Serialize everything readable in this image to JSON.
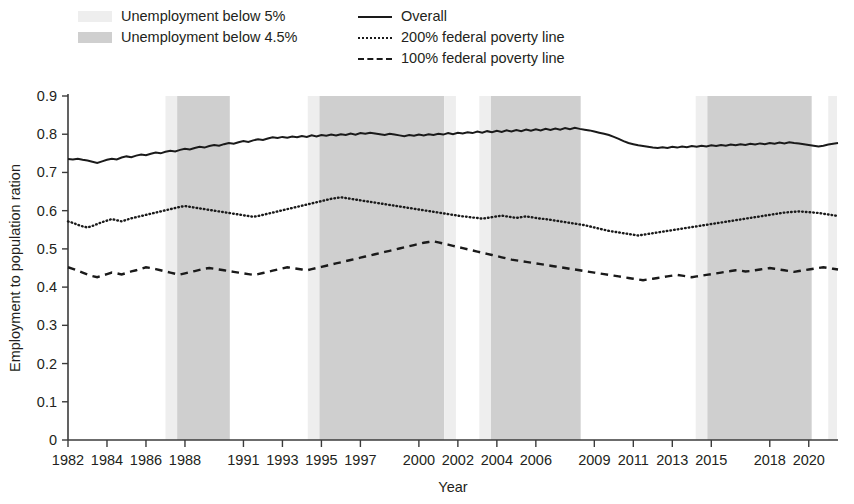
{
  "legend": {
    "bands": [
      {
        "label": "Unemployment below 5%",
        "color": "#eeeeee",
        "name": "band-below-5"
      },
      {
        "label": "Unemployment below 4.5%",
        "color": "#cfcfcf",
        "name": "band-below-4-5"
      }
    ],
    "series": [
      {
        "label": "Overall",
        "style": "solid"
      },
      {
        "label": "200% federal poverty line",
        "style": "dotted"
      },
      {
        "label": "100% federal poverty line",
        "style": "dashed"
      }
    ]
  },
  "chart_data": {
    "type": "line",
    "title": "",
    "xlabel": "Year",
    "ylabel": "Employment to population ration",
    "xlim": [
      1982,
      2021.5
    ],
    "ylim": [
      0,
      0.9
    ],
    "grid": false,
    "legend_position": "top",
    "line_color": "#1a1a1a",
    "ytick_labels": [
      "0",
      "0.1",
      "0.2",
      "0.3",
      "0.4",
      "0.5",
      "0.6",
      "0.7",
      "0.8",
      "0.9"
    ],
    "ytick_values": [
      0,
      0.1,
      0.2,
      0.3,
      0.4,
      0.5,
      0.6,
      0.7,
      0.8,
      0.9
    ],
    "xtick_labels": [
      "1982",
      "1984",
      "1986",
      "1988",
      "1991",
      "1993",
      "1995",
      "1997",
      "2000",
      "2002",
      "2004",
      "2006",
      "2009",
      "2011",
      "2013",
      "2015",
      "2018",
      "2020"
    ],
    "xtick_values": [
      1982,
      1984,
      1986,
      1988,
      1991,
      1993,
      1995,
      1997,
      2000,
      2002,
      2004,
      2006,
      2009,
      2011,
      2013,
      2015,
      2018,
      2020
    ],
    "shaded_bands": [
      {
        "name": "unemployment-below-5",
        "color": "#eeeeee",
        "x0": 1987.0,
        "x1": 1987.6
      },
      {
        "name": "unemployment-below-4-5",
        "color": "#cfcfcf",
        "x0": 1987.6,
        "x1": 1990.3
      },
      {
        "name": "unemployment-below-5",
        "color": "#eeeeee",
        "x0": 1994.3,
        "x1": 1994.9
      },
      {
        "name": "unemployment-below-4-5",
        "color": "#cfcfcf",
        "x0": 1994.9,
        "x1": 2001.3
      },
      {
        "name": "unemployment-below-5",
        "color": "#eeeeee",
        "x0": 2001.3,
        "x1": 2001.9
      },
      {
        "name": "unemployment-below-5",
        "color": "#eeeeee",
        "x0": 2003.1,
        "x1": 2003.7
      },
      {
        "name": "unemployment-below-4-5",
        "color": "#cfcfcf",
        "x0": 2003.7,
        "x1": 2008.3
      },
      {
        "name": "unemployment-below-5",
        "color": "#eeeeee",
        "x0": 2014.2,
        "x1": 2014.8
      },
      {
        "name": "unemployment-below-4-5",
        "color": "#cfcfcf",
        "x0": 2014.8,
        "x1": 2020.15
      },
      {
        "name": "unemployment-below-5",
        "color": "#eeeeee",
        "x0": 2021.0,
        "x1": 2021.45
      }
    ],
    "x": [
      1982.0,
      1982.25,
      1982.5,
      1982.75,
      1983.0,
      1983.25,
      1983.5,
      1983.75,
      1984.0,
      1984.25,
      1984.5,
      1984.75,
      1985.0,
      1985.25,
      1985.5,
      1985.75,
      1986.0,
      1986.25,
      1986.5,
      1986.75,
      1987.0,
      1987.25,
      1987.5,
      1987.75,
      1988.0,
      1988.25,
      1988.5,
      1988.75,
      1989.0,
      1989.25,
      1989.5,
      1989.75,
      1990.0,
      1990.25,
      1990.5,
      1990.75,
      1991.0,
      1991.25,
      1991.5,
      1991.75,
      1992.0,
      1992.25,
      1992.5,
      1992.75,
      1993.0,
      1993.25,
      1993.5,
      1993.75,
      1994.0,
      1994.25,
      1994.5,
      1994.75,
      1995.0,
      1995.25,
      1995.5,
      1995.75,
      1996.0,
      1996.25,
      1996.5,
      1996.75,
      1997.0,
      1997.25,
      1997.5,
      1997.75,
      1998.0,
      1998.25,
      1998.5,
      1998.75,
      1999.0,
      1999.25,
      1999.5,
      1999.75,
      2000.0,
      2000.25,
      2000.5,
      2000.75,
      2001.0,
      2001.25,
      2001.5,
      2001.75,
      2002.0,
      2002.25,
      2002.5,
      2002.75,
      2003.0,
      2003.25,
      2003.5,
      2003.75,
      2004.0,
      2004.25,
      2004.5,
      2004.75,
      2005.0,
      2005.25,
      2005.5,
      2005.75,
      2006.0,
      2006.25,
      2006.5,
      2006.75,
      2007.0,
      2007.25,
      2007.5,
      2007.75,
      2008.0,
      2008.25,
      2008.5,
      2008.75,
      2009.0,
      2009.25,
      2009.5,
      2009.75,
      2010.0,
      2010.25,
      2010.5,
      2010.75,
      2011.0,
      2011.25,
      2011.5,
      2011.75,
      2012.0,
      2012.25,
      2012.5,
      2012.75,
      2013.0,
      2013.25,
      2013.5,
      2013.75,
      2014.0,
      2014.25,
      2014.5,
      2014.75,
      2015.0,
      2015.25,
      2015.5,
      2015.75,
      2016.0,
      2016.25,
      2016.5,
      2016.75,
      2017.0,
      2017.25,
      2017.5,
      2017.75,
      2018.0,
      2018.25,
      2018.5,
      2018.75,
      2019.0,
      2019.25,
      2019.5,
      2019.75,
      2020.0,
      2020.25,
      2020.5,
      2020.75,
      2021.0,
      2021.25,
      2021.5
    ],
    "series_data": [
      {
        "name": "Overall",
        "style": "solid",
        "values": [
          0.735,
          0.734,
          0.736,
          0.733,
          0.731,
          0.728,
          0.725,
          0.729,
          0.733,
          0.736,
          0.734,
          0.739,
          0.742,
          0.74,
          0.744,
          0.747,
          0.745,
          0.749,
          0.752,
          0.75,
          0.754,
          0.757,
          0.755,
          0.759,
          0.762,
          0.76,
          0.764,
          0.767,
          0.765,
          0.769,
          0.772,
          0.77,
          0.774,
          0.777,
          0.775,
          0.779,
          0.782,
          0.78,
          0.784,
          0.787,
          0.785,
          0.789,
          0.792,
          0.79,
          0.793,
          0.791,
          0.794,
          0.792,
          0.795,
          0.793,
          0.797,
          0.794,
          0.798,
          0.796,
          0.799,
          0.797,
          0.8,
          0.798,
          0.802,
          0.799,
          0.803,
          0.801,
          0.804,
          0.802,
          0.8,
          0.798,
          0.801,
          0.799,
          0.797,
          0.795,
          0.798,
          0.796,
          0.799,
          0.797,
          0.8,
          0.798,
          0.801,
          0.799,
          0.803,
          0.8,
          0.804,
          0.802,
          0.805,
          0.803,
          0.807,
          0.804,
          0.808,
          0.805,
          0.809,
          0.806,
          0.81,
          0.807,
          0.811,
          0.808,
          0.812,
          0.809,
          0.813,
          0.81,
          0.814,
          0.811,
          0.815,
          0.812,
          0.816,
          0.813,
          0.817,
          0.814,
          0.812,
          0.81,
          0.807,
          0.804,
          0.801,
          0.798,
          0.793,
          0.788,
          0.782,
          0.777,
          0.774,
          0.771,
          0.769,
          0.767,
          0.765,
          0.764,
          0.766,
          0.764,
          0.767,
          0.765,
          0.768,
          0.766,
          0.769,
          0.767,
          0.77,
          0.768,
          0.771,
          0.769,
          0.772,
          0.77,
          0.773,
          0.771,
          0.774,
          0.772,
          0.775,
          0.773,
          0.776,
          0.774,
          0.777,
          0.775,
          0.778,
          0.776,
          0.779,
          0.777,
          0.776,
          0.774,
          0.772,
          0.77,
          0.768,
          0.77,
          0.773,
          0.775,
          0.777,
          0.779,
          0.781,
          0.783,
          0.785,
          0.787,
          0.789,
          0.791,
          0.793,
          0.795,
          0.797,
          0.8,
          0.803,
          0.806,
          0.809,
          0.812,
          0.815,
          0.818,
          0.82,
          0.821,
          0.819,
          0.76,
          0.695,
          0.745,
          0.758,
          0.775,
          0.79,
          0.797,
          0.802
        ],
        "values_note": "resampled onto x"
      },
      {
        "name": "200% federal poverty line",
        "style": "dotted",
        "values": [
          0.572,
          0.568,
          0.563,
          0.559,
          0.556,
          0.56,
          0.565,
          0.57,
          0.574,
          0.578,
          0.575,
          0.572,
          0.576,
          0.58,
          0.583,
          0.586,
          0.589,
          0.592,
          0.595,
          0.598,
          0.601,
          0.604,
          0.607,
          0.61,
          0.612,
          0.61,
          0.608,
          0.606,
          0.604,
          0.602,
          0.6,
          0.598,
          0.596,
          0.594,
          0.592,
          0.59,
          0.588,
          0.586,
          0.584,
          0.586,
          0.589,
          0.592,
          0.595,
          0.598,
          0.601,
          0.604,
          0.607,
          0.61,
          0.613,
          0.616,
          0.619,
          0.622,
          0.625,
          0.628,
          0.631,
          0.633,
          0.635,
          0.633,
          0.631,
          0.629,
          0.627,
          0.625,
          0.623,
          0.621,
          0.619,
          0.617,
          0.615,
          0.613,
          0.611,
          0.609,
          0.607,
          0.605,
          0.603,
          0.601,
          0.599,
          0.597,
          0.595,
          0.593,
          0.591,
          0.589,
          0.587,
          0.585,
          0.584,
          0.582,
          0.581,
          0.579,
          0.581,
          0.583,
          0.585,
          0.587,
          0.585,
          0.583,
          0.581,
          0.583,
          0.585,
          0.583,
          0.581,
          0.579,
          0.578,
          0.576,
          0.574,
          0.572,
          0.57,
          0.568,
          0.566,
          0.564,
          0.562,
          0.559,
          0.556,
          0.553,
          0.55,
          0.547,
          0.545,
          0.543,
          0.541,
          0.539,
          0.537,
          0.535,
          0.537,
          0.539,
          0.541,
          0.543,
          0.545,
          0.547,
          0.549,
          0.551,
          0.553,
          0.555,
          0.557,
          0.559,
          0.561,
          0.563,
          0.565,
          0.567,
          0.569,
          0.571,
          0.573,
          0.575,
          0.577,
          0.579,
          0.581,
          0.583,
          0.585,
          0.587,
          0.589,
          0.591,
          0.593,
          0.595,
          0.596,
          0.597,
          0.598,
          0.597,
          0.596,
          0.595,
          0.594,
          0.592,
          0.59,
          0.588,
          0.586,
          0.584,
          0.582,
          0.58,
          0.578,
          0.576,
          0.574,
          0.572,
          0.57,
          0.568,
          0.566,
          0.564,
          0.562,
          0.56,
          0.558,
          0.556,
          0.554,
          0.552,
          0.545,
          0.53,
          0.505,
          0.508,
          0.512,
          0.515,
          0.518,
          0.52
        ],
        "values_note": "resampled onto x"
      },
      {
        "name": "100% federal poverty line",
        "style": "dashed",
        "values": [
          0.452,
          0.448,
          0.443,
          0.438,
          0.433,
          0.429,
          0.426,
          0.43,
          0.434,
          0.438,
          0.436,
          0.433,
          0.437,
          0.441,
          0.444,
          0.448,
          0.452,
          0.45,
          0.447,
          0.444,
          0.441,
          0.438,
          0.435,
          0.433,
          0.436,
          0.439,
          0.442,
          0.445,
          0.448,
          0.45,
          0.448,
          0.446,
          0.444,
          0.442,
          0.44,
          0.438,
          0.436,
          0.434,
          0.432,
          0.434,
          0.437,
          0.44,
          0.443,
          0.446,
          0.449,
          0.452,
          0.45,
          0.448,
          0.446,
          0.444,
          0.447,
          0.45,
          0.453,
          0.456,
          0.459,
          0.462,
          0.465,
          0.468,
          0.471,
          0.474,
          0.477,
          0.48,
          0.483,
          0.486,
          0.489,
          0.492,
          0.495,
          0.498,
          0.501,
          0.504,
          0.507,
          0.51,
          0.513,
          0.516,
          0.518,
          0.52,
          0.517,
          0.514,
          0.511,
          0.508,
          0.505,
          0.502,
          0.499,
          0.496,
          0.493,
          0.49,
          0.487,
          0.484,
          0.481,
          0.478,
          0.475,
          0.472,
          0.47,
          0.468,
          0.466,
          0.464,
          0.462,
          0.46,
          0.458,
          0.456,
          0.454,
          0.452,
          0.45,
          0.448,
          0.446,
          0.444,
          0.442,
          0.44,
          0.438,
          0.436,
          0.434,
          0.432,
          0.43,
          0.428,
          0.426,
          0.424,
          0.422,
          0.42,
          0.418,
          0.42,
          0.422,
          0.424,
          0.426,
          0.428,
          0.43,
          0.432,
          0.43,
          0.428,
          0.426,
          0.428,
          0.43,
          0.432,
          0.434,
          0.436,
          0.438,
          0.44,
          0.442,
          0.444,
          0.443,
          0.441,
          0.442,
          0.444,
          0.446,
          0.448,
          0.45,
          0.448,
          0.446,
          0.444,
          0.442,
          0.44,
          0.442,
          0.444,
          0.446,
          0.448,
          0.45,
          0.452,
          0.45,
          0.448,
          0.446,
          0.444,
          0.442,
          0.44,
          0.438,
          0.436,
          0.434,
          0.432,
          0.43,
          0.425,
          0.4,
          0.368,
          0.37,
          0.385,
          0.4,
          0.412,
          0.42
        ],
        "values_note": "resampled onto x"
      }
    ]
  }
}
